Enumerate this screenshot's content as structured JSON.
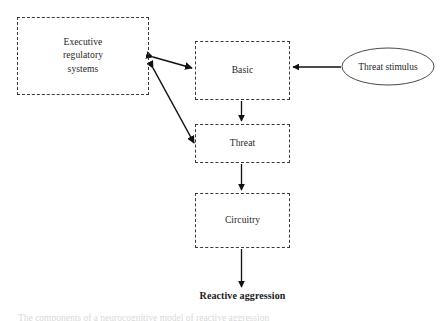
{
  "figure": {
    "background_color": "#ffffff",
    "stroke_color": "#3a3a3a",
    "arrow_color": "#111111",
    "text_color": "#262626"
  },
  "nodes": {
    "executive": {
      "label": "Executive\nregulatory\nsystems",
      "shape": "dashed-rectangle"
    },
    "basic": {
      "label": "Basic",
      "shape": "dashed-rectangle"
    },
    "threat": {
      "label": "Threat",
      "shape": "dashed-rectangle"
    },
    "circuitry": {
      "label": "Circuitry",
      "shape": "dashed-rectangle"
    },
    "stimulus": {
      "label": "Threat stimulus",
      "shape": "ellipse"
    }
  },
  "outcome": {
    "label": "Reactive aggression"
  },
  "caption": {
    "text": "The components of a neurocognitive model of reactive aggression"
  },
  "connectors": [
    {
      "name": "executive-basic",
      "from": "executive",
      "to": "basic",
      "style": "double-headed-arrow"
    },
    {
      "name": "executive-threat",
      "from": "executive",
      "to": "threat",
      "style": "double-headed-arrow"
    },
    {
      "name": "stimulus-basic",
      "from": "stimulus",
      "to": "basic",
      "style": "single-headed-arrow"
    },
    {
      "name": "basic-threat",
      "from": "basic",
      "to": "threat",
      "style": "single-headed-arrow"
    },
    {
      "name": "threat-circuitry",
      "from": "threat",
      "to": "circuitry",
      "style": "single-headed-arrow"
    },
    {
      "name": "circuitry-outcome",
      "from": "circuitry",
      "to": "outcome",
      "style": "single-headed-arrow"
    }
  ]
}
